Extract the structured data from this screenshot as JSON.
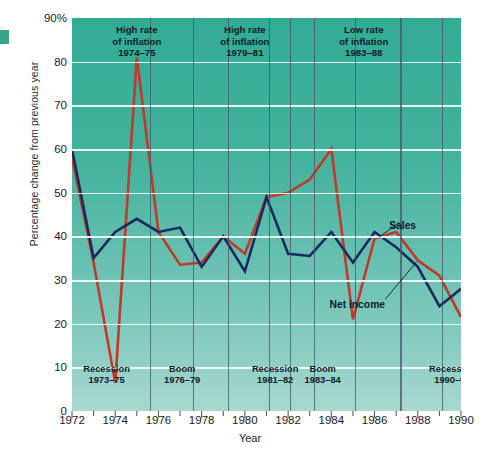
{
  "chart_data": {
    "type": "line",
    "title": "",
    "xlabel": "Year",
    "ylabel": "Percentage change from previous year",
    "xlim": [
      1972,
      1990
    ],
    "ylim": [
      0,
      90
    ],
    "ytick_labels": [
      "90%",
      "80",
      "70",
      "60",
      "50",
      "40",
      "30",
      "20",
      "10",
      "0"
    ],
    "ytick_values": [
      90,
      80,
      70,
      60,
      50,
      40,
      30,
      20,
      10,
      0
    ],
    "xtick_labels": [
      "1972",
      "1974",
      "1976",
      "1978",
      "1980",
      "1982",
      "1984",
      "1986",
      "1988",
      "1990"
    ],
    "xtick_values": [
      1972,
      1974,
      1976,
      1978,
      1980,
      1982,
      1984,
      1986,
      1988,
      1990
    ],
    "minor_xticks": [
      1973,
      1975,
      1977,
      1979,
      1981,
      1983,
      1985,
      1987,
      1989
    ],
    "grid": true,
    "legend_position": "inline-annotation",
    "x": [
      1972,
      1973,
      1974,
      1975,
      1976,
      1977,
      1978,
      1979,
      1980,
      1981,
      1982,
      1983,
      1984,
      1985,
      1986,
      1987,
      1988,
      1989,
      1990
    ],
    "series": [
      {
        "name": "Sales",
        "color": "#1b2a5e",
        "values": [
          60,
          35,
          41,
          44,
          41,
          42,
          33,
          40,
          32,
          49,
          36,
          35.5,
          41,
          34,
          41,
          37.5,
          33,
          24,
          28
        ]
      },
      {
        "name": "Net income",
        "color": "#c0392b",
        "values": [
          58,
          34,
          6.5,
          81,
          41,
          33.5,
          34,
          40,
          36,
          49,
          50,
          53,
          60,
          21,
          39.5,
          41,
          34.5,
          31,
          21.5
        ]
      }
    ],
    "annotations_top": [
      {
        "lines": [
          "High rate",
          "of inflation",
          "1974–75"
        ],
        "x_center": 1975
      },
      {
        "lines": [
          "High rate",
          "of inflation",
          "1979–81"
        ],
        "x_center": 1980
      },
      {
        "lines": [
          "Low rate",
          "of inflation",
          "1983–88"
        ],
        "x_center": 1985.5
      }
    ],
    "annotations_bottom": [
      {
        "lines": [
          "Recession",
          "1973–75"
        ],
        "x_center": 1973.6
      },
      {
        "lines": [
          "Boom",
          "1976–79"
        ],
        "x_center": 1977.1
      },
      {
        "lines": [
          "Recession",
          "1981–82"
        ],
        "x_center": 1981.4
      },
      {
        "lines": [
          "Boom",
          "1983–84"
        ],
        "x_center": 1983.6
      },
      {
        "lines": [
          "Recession",
          "1990–91"
        ],
        "x_center": 1989.6
      }
    ],
    "vertical_dividers": [
      1975.6,
      1977.6,
      1979.2,
      1981.1,
      1982.1,
      1983.2,
      1985.1,
      1987.2,
      1989.1
    ],
    "series_callouts": [
      {
        "label": "Sales",
        "x": 1987.3,
        "y": 42.5
      },
      {
        "label": "Net income",
        "x": 1985.2,
        "y": 24.5
      }
    ],
    "colors": {
      "plot_background_top": "#33ab94",
      "plot_background_bottom": "#a8d8d0",
      "gridline": "#f2fbf8",
      "sales_line": "#1b2a5e",
      "net_income_line": "#c0392b",
      "text": "#1b1b1b",
      "edge_mark": "#36a58c"
    }
  }
}
